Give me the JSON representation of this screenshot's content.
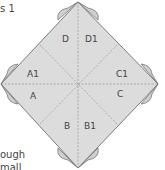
{
  "caption": {
    "top_fragment": "s 1",
    "bottom_fragment_1": "ough",
    "bottom_fragment_2": "mall"
  },
  "diagram": {
    "labels": {
      "D": "D",
      "D1": "D1",
      "A1": "A1",
      "A": "A",
      "C1": "C1",
      "C": "C",
      "B": "B",
      "B1": "B1"
    },
    "colors": {
      "fill": "#dcdcdc",
      "flap": "#cfcfcf",
      "stroke": "#7a7a7a",
      "fold": "#8a8a8a"
    }
  }
}
